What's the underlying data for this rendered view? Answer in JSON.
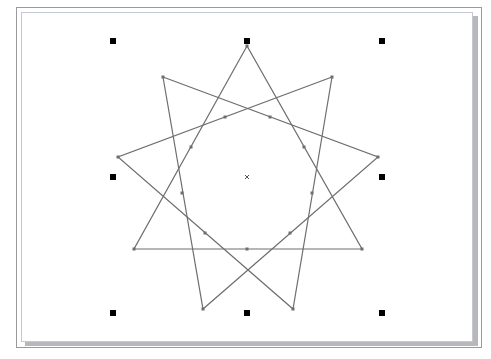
{
  "canvas": {
    "background": "#ffffff",
    "line_color": "#6e6e6e",
    "handle_color": "#000000"
  },
  "shape": {
    "type": "star-polygon",
    "points": 9,
    "triangles": [
      [
        [
          247,
          46
        ],
        [
          134,
          249
        ],
        [
          362,
          249
        ]
      ],
      [
        [
          163,
          77
        ],
        [
          378,
          157
        ],
        [
          203,
          309
        ]
      ],
      [
        [
          332,
          77
        ],
        [
          118,
          157
        ],
        [
          293,
          309
        ]
      ]
    ],
    "inner_nodes": [
      [
        225,
        117
      ],
      [
        270,
        117
      ],
      [
        191,
        147
      ],
      [
        304,
        147
      ],
      [
        182,
        193
      ],
      [
        312,
        193
      ],
      [
        205,
        233
      ],
      [
        290,
        233
      ],
      [
        247,
        249
      ]
    ],
    "center": [
      247,
      177
    ]
  },
  "selection_handles": [
    {
      "name": "top-left",
      "x": 113,
      "y": 41
    },
    {
      "name": "top-center",
      "x": 247,
      "y": 41
    },
    {
      "name": "top-right",
      "x": 382,
      "y": 41
    },
    {
      "name": "middle-left",
      "x": 113,
      "y": 177
    },
    {
      "name": "middle-right",
      "x": 382,
      "y": 177
    },
    {
      "name": "bottom-left",
      "x": 113,
      "y": 313
    },
    {
      "name": "bottom-center",
      "x": 247,
      "y": 313
    },
    {
      "name": "bottom-right",
      "x": 382,
      "y": 313
    }
  ]
}
